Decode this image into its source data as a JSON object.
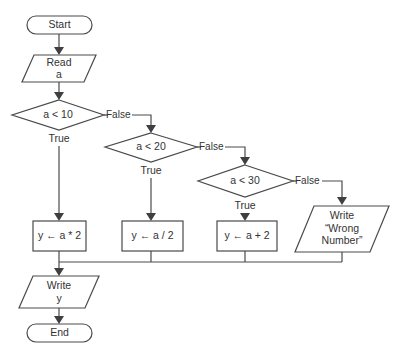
{
  "diagram": {
    "type": "flowchart",
    "nodes": {
      "start": {
        "label": "Start",
        "shape": "terminal"
      },
      "read": {
        "line1": "Read",
        "line2": "a",
        "shape": "parallelogram"
      },
      "cond1": {
        "label": "a < 10",
        "shape": "decision"
      },
      "cond2": {
        "label": "a < 20",
        "shape": "decision"
      },
      "cond3": {
        "label": "a < 30",
        "shape": "decision"
      },
      "proc1": {
        "label": "y ← a * 2",
        "shape": "process"
      },
      "proc2": {
        "label": "y ← a / 2",
        "shape": "process"
      },
      "proc3": {
        "label": "y ← a + 2",
        "shape": "process"
      },
      "write_err": {
        "line1": "Write",
        "line2": "“Wrong",
        "line3": "Number”",
        "shape": "parallelogram"
      },
      "write_y": {
        "line1": "Write",
        "line2": "y",
        "shape": "parallelogram"
      },
      "end": {
        "label": "End",
        "shape": "terminal"
      }
    },
    "edge_labels": {
      "c1_true": "True",
      "c1_false": "False",
      "c2_true": "True",
      "c2_false": "False",
      "c3_true": "True",
      "c3_false": "False"
    },
    "colors": {
      "stroke": "#4a4a4a",
      "arrow": "#3f3f3f",
      "text": "#333333",
      "background": "#ffffff"
    }
  }
}
